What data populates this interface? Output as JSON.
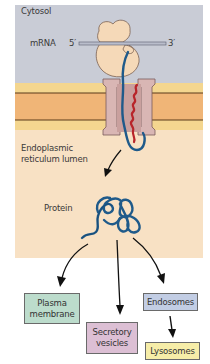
{
  "diagram": {
    "regions": {
      "cytosol": {
        "label": "Cytosol",
        "color": "#c9ccd6"
      },
      "membrane": {
        "outer_color": "#f4d68f",
        "inner_color": "#f0b577",
        "line_color": "#5a3a1a"
      },
      "lumen": {
        "label_line1": "Endoplasmic",
        "label_line2": "reticulum lumen",
        "color": "#f8e1c4"
      }
    },
    "mrna": {
      "label": "mRNA",
      "five_prime": "5′",
      "three_prime": "3′"
    },
    "protein": {
      "label": "Protein",
      "color": "#1f5a8a"
    },
    "signal_sequence_color": "#b8252a",
    "ribosome_color": "#f5d9b8",
    "translocon_color": "#d9b6b4",
    "destinations": [
      {
        "id": "plasma-membrane",
        "line1": "Plasma",
        "line2": "membrane",
        "color": "#bcdccc"
      },
      {
        "id": "secretory-vesicles",
        "line1": "Secretory",
        "line2": "vesicles",
        "color": "#dcbfd4"
      },
      {
        "id": "endosomes",
        "line1": "Endosomes",
        "line2": "",
        "color": "#c2cde4"
      },
      {
        "id": "lysosomes",
        "line1": "Lysosomes",
        "line2": "",
        "color": "#f6eda8"
      }
    ]
  }
}
